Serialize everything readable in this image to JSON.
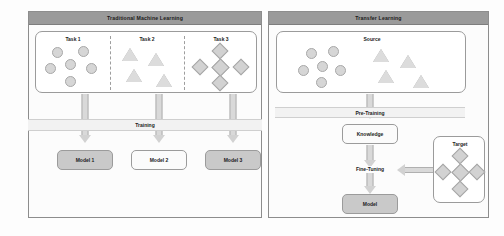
{
  "left_panel": {
    "title": "Traditional Machine Learning",
    "tasks": [
      {
        "label": "Task 1",
        "shape": "circle",
        "count": 6
      },
      {
        "label": "Task 2",
        "shape": "triangle",
        "count": 4
      },
      {
        "label": "Task 3",
        "shape": "diamond",
        "count": 5
      }
    ],
    "process_band": "Training",
    "models": [
      {
        "label": "Model 1",
        "fill": "gray"
      },
      {
        "label": "Model 2",
        "fill": "white"
      },
      {
        "label": "Model 3",
        "fill": "gray"
      }
    ]
  },
  "right_panel": {
    "title": "Transfer Learning",
    "source": {
      "label": "Source",
      "circles": 6,
      "triangles": 4
    },
    "process_band": "Pre-Training",
    "knowledge": {
      "label": "Knowledge",
      "fill": "white"
    },
    "fine_tuning": {
      "label": "Fine-Tuning"
    },
    "target": {
      "label": "Target",
      "diamonds": 5
    },
    "model": {
      "label": "Model",
      "fill": "gray"
    }
  },
  "colors": {
    "title_bar": "#9a9a9a",
    "shape_fill": "#d6d6d6",
    "shape_stroke": "#a8a8a8",
    "arrow_fill": "#d9d9d9",
    "band_fill": "#f2f2f2",
    "node_gray": "#c9c9c9",
    "panel_border": "#8d8d8d"
  }
}
